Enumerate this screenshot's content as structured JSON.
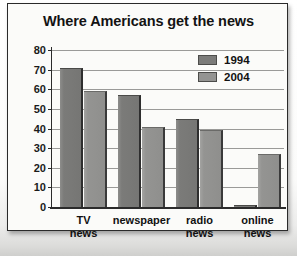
{
  "chart_data": {
    "type": "bar",
    "title": "Where Americans get the news",
    "xlabel": "",
    "ylabel": "Percent of people",
    "ylim": [
      0,
      80
    ],
    "ytick_step": 10,
    "yticks": [
      80,
      70,
      60,
      50,
      40,
      30,
      20,
      10,
      0
    ],
    "grid": true,
    "legend_position": "top-right",
    "categories": [
      "TV news",
      "newspaper",
      "radio news",
      "online news"
    ],
    "category_lines": [
      [
        "TV",
        "news"
      ],
      [
        "newspaper"
      ],
      [
        "radio",
        "news"
      ],
      [
        "online",
        "news"
      ]
    ],
    "series": [
      {
        "name": "1994",
        "color": "#7b7b79",
        "values": [
          71,
          57,
          45,
          1
        ]
      },
      {
        "name": "2004",
        "color": "#949492",
        "values": [
          59,
          41,
          39,
          27
        ]
      }
    ]
  }
}
